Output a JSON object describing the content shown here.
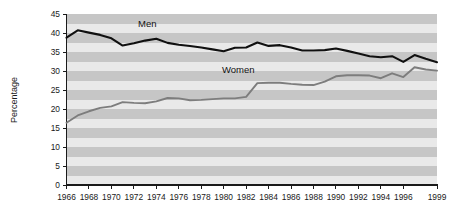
{
  "chart_data": {
    "type": "line",
    "title": "",
    "xlabel": "",
    "ylabel": "Percentage",
    "ylim": [
      0,
      45
    ],
    "xlim": [
      1966,
      1999
    ],
    "yticks": [
      0,
      5,
      10,
      15,
      20,
      25,
      30,
      35,
      40,
      45
    ],
    "ytick_labels": [
      "0",
      "5",
      "10",
      "15",
      "20",
      "25",
      "30",
      "35",
      "40",
      "45"
    ],
    "xticks": [
      1966,
      1968,
      1970,
      1972,
      1974,
      1976,
      1978,
      1980,
      1982,
      1984,
      1986,
      1988,
      1990,
      1992,
      1994,
      1996,
      1999
    ],
    "xtick_labels": [
      "1966",
      "1968",
      "1970",
      "1972",
      "1974",
      "1976",
      "1978",
      "1980",
      "1982",
      "1984",
      "1986",
      "1988",
      "1990",
      "1992",
      "1994",
      "1996",
      "1999"
    ],
    "grid": false,
    "background_stripes": true,
    "stripe_colors": [
      "#e9e9e9",
      "#c6c6c6"
    ],
    "stripe_step": 2.5,
    "legend_position": "inline-annotation",
    "x": [
      1966,
      1967,
      1968,
      1969,
      1970,
      1971,
      1972,
      1973,
      1974,
      1975,
      1976,
      1977,
      1978,
      1979,
      1980,
      1981,
      1982,
      1983,
      1984,
      1985,
      1986,
      1987,
      1988,
      1989,
      1990,
      1991,
      1992,
      1993,
      1994,
      1995,
      1996,
      1997,
      1998,
      1999
    ],
    "series": [
      {
        "name": "Men",
        "color": "#101010",
        "stroke_width": 2.1,
        "label": "Men",
        "label_x": 1973.2,
        "label_y": 41.6,
        "values": [
          38.8,
          40.7,
          40.1,
          39.5,
          38.6,
          36.7,
          37.3,
          38.0,
          38.5,
          37.4,
          36.9,
          36.6,
          36.2,
          35.7,
          35.2,
          36.1,
          36.2,
          37.5,
          36.6,
          36.8,
          36.2,
          35.4,
          35.4,
          35.5,
          35.9,
          35.3,
          34.6,
          33.9,
          33.6,
          33.9,
          32.4,
          34.2,
          33.2,
          32.3
        ]
      },
      {
        "name": "Women",
        "color": "#7d7d7d",
        "stroke_width": 1.9,
        "label": "Women",
        "label_x": 1981.3,
        "label_y": 29.6,
        "values": [
          16.4,
          18.3,
          19.4,
          20.3,
          20.7,
          21.8,
          21.6,
          21.5,
          22.0,
          22.9,
          22.8,
          22.3,
          22.4,
          22.6,
          22.8,
          22.8,
          23.2,
          26.8,
          26.9,
          26.9,
          26.6,
          26.4,
          26.3,
          27.2,
          28.6,
          28.9,
          28.9,
          28.8,
          28.1,
          29.4,
          28.4,
          31.0,
          30.4,
          30.1
        ]
      }
    ]
  },
  "axes": {
    "y_axis_title": "Percentage"
  }
}
